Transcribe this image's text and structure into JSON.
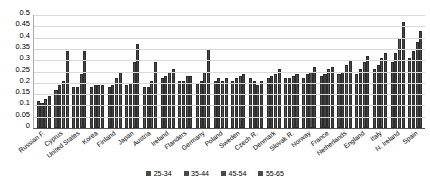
{
  "chart_data": {
    "type": "bar",
    "title": "",
    "xlabel": "",
    "ylabel": "",
    "ylim": [
      0,
      0.5
    ],
    "grid": true,
    "legend_position": "bottom",
    "ytick_labels": [
      "0.5",
      "0.45",
      "0.4",
      "0.35",
      "0.3",
      "0.25",
      "0.2",
      "0.15",
      "0.1",
      "0.05",
      "0"
    ],
    "ytick_values": [
      0.5,
      0.45,
      0.4,
      0.35,
      0.3,
      0.25,
      0.2,
      0.15,
      0.1,
      0.05,
      0
    ],
    "categories": [
      "Russian F.",
      "Cyprus",
      "United States",
      "Korea",
      "Finland",
      "Japan",
      "Austria",
      "Ireland",
      "Flanders",
      "Germany",
      "Poland",
      "Sweden",
      "Czech R.",
      "Denmark",
      "Slovak R.",
      "Norway",
      "France",
      "Netherlands",
      "England",
      "Italy",
      "N. Ireland",
      "Spain"
    ],
    "series": [
      {
        "name": "25-34",
        "values": [
          0.12,
          0.17,
          0.18,
          0.18,
          0.18,
          0.19,
          0.18,
          0.22,
          0.21,
          0.2,
          0.21,
          0.21,
          0.22,
          0.22,
          0.22,
          0.22,
          0.23,
          0.24,
          0.24,
          0.26,
          0.29,
          0.31
        ]
      },
      {
        "name": "35-44",
        "values": [
          0.11,
          0.19,
          0.18,
          0.19,
          0.19,
          0.2,
          0.18,
          0.23,
          0.21,
          0.21,
          0.22,
          0.22,
          0.21,
          0.23,
          0.22,
          0.24,
          0.24,
          0.25,
          0.26,
          0.28,
          0.33,
          0.34
        ]
      },
      {
        "name": "45-54",
        "values": [
          0.13,
          0.21,
          0.24,
          0.19,
          0.22,
          0.29,
          0.21,
          0.25,
          0.23,
          0.25,
          0.21,
          0.23,
          0.19,
          0.24,
          0.23,
          0.25,
          0.26,
          0.28,
          0.29,
          0.31,
          0.4,
          0.38
        ]
      },
      {
        "name": "55-65",
        "values": [
          0.14,
          0.34,
          0.34,
          0.19,
          0.25,
          0.37,
          0.29,
          0.26,
          0.23,
          0.35,
          0.22,
          0.24,
          0.21,
          0.26,
          0.24,
          0.27,
          0.27,
          0.3,
          0.32,
          0.33,
          0.47,
          0.43
        ]
      }
    ]
  },
  "legend": {
    "items": [
      {
        "label": "25-34"
      },
      {
        "label": "35-44"
      },
      {
        "label": "45-54"
      },
      {
        "label": "55-65"
      }
    ]
  },
  "colors": {
    "bar": "#4a4a4a",
    "gridline": "#d9d9d9",
    "axis": "#555555",
    "background": "#ffffff",
    "text": "#000000"
  }
}
